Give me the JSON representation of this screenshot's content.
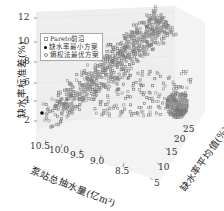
{
  "chart_data": {
    "type": "scatter",
    "subtype": "3d-scatter",
    "title": "",
    "axes": {
      "x": {
        "label": "泵站总抽水量(亿m³)",
        "ticks": [
          "10.5",
          "10.0",
          "9.5",
          "9.0",
          "8.5"
        ],
        "range": [
          8.3,
          10.6
        ]
      },
      "y": {
        "label": "缺水率平均值(%)",
        "ticks": [
          "5",
          "10",
          "15",
          "20",
          "25"
        ],
        "range": [
          3,
          27
        ]
      },
      "z": {
        "label": "缺水率标准差(%)",
        "ticks": [
          "2",
          "4",
          "6",
          "8",
          "10",
          "12"
        ],
        "range": [
          1.5,
          12.5
        ]
      }
    },
    "legend": [
      {
        "label": "Pareto前沿",
        "marker": "open-square",
        "color": "#999999"
      },
      {
        "label": "缺水率最小方案",
        "marker": "filled-circle",
        "color": "#000000"
      },
      {
        "label": "熵权法最优方案",
        "marker": "open-circle",
        "color": "#888888"
      }
    ],
    "series": [
      {
        "name": "Pareto前沿",
        "description": "~1000 points forming a diagonal band rising from low std (~2%) at high pumping volume to high std (~11%) toward mid pumping volume, plus a dense cluster at high mean shortage rate (~25%) and low std"
      },
      {
        "name": "缺水率最小方案",
        "points": [
          {
            "x": 10.5,
            "y": 5,
            "z": 2.4
          }
        ]
      },
      {
        "name": "熵权法最优方案",
        "points": []
      }
    ],
    "grid": true,
    "legend_position": "upper-left"
  },
  "labels": {
    "ytitle": "缺水率标准差(%)",
    "xtitle": "泵站总抽水量(亿m³)",
    "ztitle": "缺水率平均值(%)",
    "legend0": "Pareto前沿",
    "legend1": "缺水率最小方案",
    "legend2": "熵权法最优方案",
    "zt": [
      "12",
      "10",
      "8",
      "6",
      "4",
      "2"
    ],
    "xt": [
      "10.5",
      "10.0",
      "9.5",
      "9.0",
      "8.5"
    ],
    "yt": [
      "5",
      "10",
      "15",
      "20",
      "25"
    ]
  }
}
